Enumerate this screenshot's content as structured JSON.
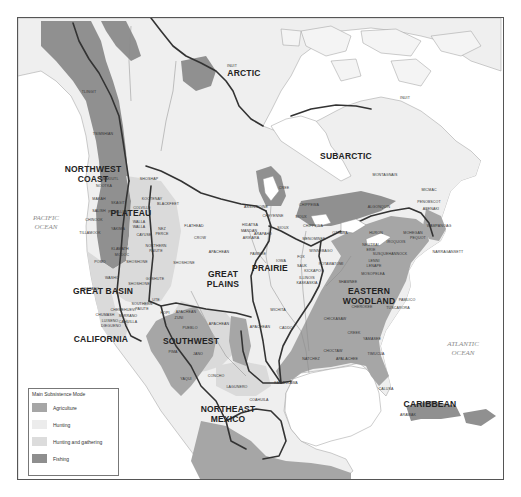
{
  "map": {
    "title": "Main Subsistence Modes of Native North American Culture Areas",
    "oceans": [
      {
        "name": "pacific",
        "lines": [
          "PACIFIC",
          "OCEAN"
        ],
        "x": 45,
        "y": 219
      },
      {
        "name": "atlantic",
        "lines": [
          "ATLANTIC",
          "OCEAN"
        ],
        "x": 462,
        "y": 345
      }
    ],
    "culture_areas": [
      {
        "name": "ARCTIC",
        "x": 243,
        "y": 75
      },
      {
        "name": "SUBARCTIC",
        "x": 345,
        "y": 158
      },
      {
        "name": "NORTHWEST",
        "line2": "COAST",
        "x": 92,
        "y": 171
      },
      {
        "name": "PLATEAU",
        "x": 130,
        "y": 215
      },
      {
        "name": "GREAT BASIN",
        "x": 102,
        "y": 293
      },
      {
        "name": "CALIFORNIA",
        "x": 100,
        "y": 341
      },
      {
        "name": "GREAT",
        "line2": "PLAINS",
        "x": 222,
        "y": 276
      },
      {
        "name": "PRAIRIE",
        "x": 269,
        "y": 270
      },
      {
        "name": "EASTERN",
        "line2": "WOODLAND",
        "x": 368,
        "y": 293
      },
      {
        "name": "SOUTHWEST",
        "x": 190,
        "y": 343
      },
      {
        "name": "NORTHEAST",
        "line2": "MEXICO",
        "x": 227,
        "y": 411
      },
      {
        "name": "CARIBBEAN",
        "x": 429,
        "y": 406
      }
    ],
    "tribes": [
      {
        "name": "INUIT",
        "x": 231,
        "y": 66
      },
      {
        "name": "INUIT",
        "x": 404,
        "y": 98
      },
      {
        "name": "TLINGIT",
        "x": 88,
        "y": 92
      },
      {
        "name": "TSIMSHIAN",
        "x": 102,
        "y": 134
      },
      {
        "name": "KWAKIUTL",
        "x": 108,
        "y": 179
      },
      {
        "name": "SHOSHAP",
        "x": 148,
        "y": 179
      },
      {
        "name": "NOOTKA",
        "x": 103,
        "y": 186
      },
      {
        "name": "MAKAH",
        "x": 98,
        "y": 199
      },
      {
        "name": "KOOTENAY",
        "x": 151,
        "y": 199
      },
      {
        "name": "BLACKFEET",
        "x": 167,
        "y": 204
      },
      {
        "name": "SKAGIT",
        "x": 117,
        "y": 203
      },
      {
        "name": "SALISH",
        "x": 98,
        "y": 211
      },
      {
        "name": "COLVILLE",
        "x": 141,
        "y": 208
      },
      {
        "name": "PUYALLUP",
        "x": 117,
        "y": 212
      },
      {
        "name": "CHINOOK",
        "x": 93,
        "y": 220
      },
      {
        "name": "WALLA",
        "line2": "WALLA",
        "x": 138,
        "y": 222
      },
      {
        "name": "TILLAMOOK",
        "x": 89,
        "y": 233
      },
      {
        "name": "YAKIMA",
        "x": 117,
        "y": 229
      },
      {
        "name": "CAYUSE",
        "x": 143,
        "y": 235
      },
      {
        "name": "NEZ",
        "line2": "PERCE",
        "x": 161,
        "y": 229
      },
      {
        "name": "KLAMATH",
        "x": 119,
        "y": 249
      },
      {
        "name": "MODOC",
        "x": 121,
        "y": 255
      },
      {
        "name": "NORTHERN",
        "line2": "PAIUTE",
        "x": 155,
        "y": 246
      },
      {
        "name": "POMO",
        "x": 99,
        "y": 262
      },
      {
        "name": "WASHO",
        "x": 111,
        "y": 278
      },
      {
        "name": "COSTANO",
        "x": 89,
        "y": 289
      },
      {
        "name": "SHOSHONE",
        "x": 136,
        "y": 262
      },
      {
        "name": "GOSHUTE",
        "x": 154,
        "y": 279
      },
      {
        "name": "SHOSHONE",
        "x": 138,
        "y": 284
      },
      {
        "name": "CHEMEHUEVI",
        "x": 122,
        "y": 310
      },
      {
        "name": "SERRANO",
        "x": 127,
        "y": 316
      },
      {
        "name": "CHUMASH",
        "x": 104,
        "y": 315
      },
      {
        "name": "CAHUILLA",
        "x": 127,
        "y": 322
      },
      {
        "name": "LUISENO",
        "x": 109,
        "y": 321
      },
      {
        "name": "DIEGUENO",
        "x": 110,
        "y": 326
      },
      {
        "name": "SOUTHERN",
        "line2": "PAIUTE",
        "x": 141,
        "y": 304
      },
      {
        "name": "UTE",
        "x": 155,
        "y": 300
      },
      {
        "name": "HOPI",
        "x": 164,
        "y": 313
      },
      {
        "name": "ZUNI",
        "x": 178,
        "y": 318
      },
      {
        "name": "APACHEAN",
        "x": 185,
        "y": 312
      },
      {
        "name": "PUEBLO",
        "x": 189,
        "y": 328
      },
      {
        "name": "PIMA",
        "x": 172,
        "y": 352
      },
      {
        "name": "JANO",
        "x": 197,
        "y": 354
      },
      {
        "name": "YAQUI",
        "x": 185,
        "y": 379
      },
      {
        "name": "CONCHO",
        "x": 215,
        "y": 376
      },
      {
        "name": "LAGUNERO",
        "x": 236,
        "y": 387
      },
      {
        "name": "COAHUILA",
        "x": 258,
        "y": 400
      },
      {
        "name": "KARANKAWA",
        "x": 285,
        "y": 383
      },
      {
        "name": "FLATHEAD",
        "x": 193,
        "y": 226
      },
      {
        "name": "CROW",
        "x": 199,
        "y": 238
      },
      {
        "name": "APACHEAN",
        "x": 218,
        "y": 252
      },
      {
        "name": "SHOSHONE",
        "x": 183,
        "y": 263
      },
      {
        "name": "APACHEAN",
        "x": 259,
        "y": 327
      },
      {
        "name": "APACHEAN",
        "x": 218,
        "y": 324
      },
      {
        "name": "ASSINIBOINE",
        "x": 255,
        "y": 207
      },
      {
        "name": "CREE",
        "x": 283,
        "y": 188
      },
      {
        "name": "CHEYENNE",
        "x": 272,
        "y": 216
      },
      {
        "name": "HIDATSA",
        "x": 249,
        "y": 225
      },
      {
        "name": "MANDAN",
        "x": 248,
        "y": 231
      },
      {
        "name": "ARIKARA",
        "x": 250,
        "y": 238
      },
      {
        "name": "ARAPAHO",
        "x": 262,
        "y": 234
      },
      {
        "name": "SIOUX",
        "x": 282,
        "y": 228
      },
      {
        "name": "CHIPPEWA",
        "x": 308,
        "y": 205
      },
      {
        "name": "SIOUX",
        "x": 300,
        "y": 217
      },
      {
        "name": "CHIPPEWA",
        "x": 312,
        "y": 226
      },
      {
        "name": "OTTAWA",
        "x": 339,
        "y": 233
      },
      {
        "name": "MENOMINEE",
        "x": 313,
        "y": 239
      },
      {
        "name": "WINNEBAGO",
        "x": 320,
        "y": 251
      },
      {
        "name": "PAWNEE",
        "x": 257,
        "y": 254
      },
      {
        "name": "IOWA",
        "x": 280,
        "y": 261
      },
      {
        "name": "FOX",
        "x": 300,
        "y": 257
      },
      {
        "name": "SAUK",
        "x": 301,
        "y": 266
      },
      {
        "name": "POTAWATOMI",
        "x": 330,
        "y": 264
      },
      {
        "name": "KICKAPOO",
        "x": 313,
        "y": 271
      },
      {
        "name": "ILLINOIS",
        "line2": "KASKASKIA",
        "x": 306,
        "y": 278
      },
      {
        "name": "WICHITA",
        "x": 277,
        "y": 310
      },
      {
        "name": "CADDO",
        "x": 285,
        "y": 328
      },
      {
        "name": "ALGONQUIN",
        "x": 378,
        "y": 207
      },
      {
        "name": "MONTAGNAIS",
        "x": 384,
        "y": 175
      },
      {
        "name": "MICMAC",
        "x": 428,
        "y": 190
      },
      {
        "name": "PENOBSCOT",
        "x": 428,
        "y": 202
      },
      {
        "name": "ABENAKI",
        "x": 430,
        "y": 209
      },
      {
        "name": "WAMPANOAG",
        "x": 438,
        "y": 226
      },
      {
        "name": "MOHEGAN",
        "x": 412,
        "y": 233
      },
      {
        "name": "PEQUOT",
        "x": 417,
        "y": 238
      },
      {
        "name": "NARRAGANSETT",
        "x": 447,
        "y": 252
      },
      {
        "name": "HURON",
        "x": 375,
        "y": 233
      },
      {
        "name": "IROQUOIS",
        "x": 395,
        "y": 242
      },
      {
        "name": "NEUTRAL",
        "line2": "ERIE",
        "x": 370,
        "y": 245
      },
      {
        "name": "SUSQUEHANNOCK",
        "x": 389,
        "y": 254
      },
      {
        "name": "LENNI",
        "line2": "LENAPE",
        "x": 373,
        "y": 261
      },
      {
        "name": "MOSOPELEA",
        "x": 372,
        "y": 274
      },
      {
        "name": "SHAWNEE",
        "x": 347,
        "y": 282
      },
      {
        "name": "CHEROKEE",
        "x": 361,
        "y": 307
      },
      {
        "name": "PAMLICO",
        "x": 406,
        "y": 300
      },
      {
        "name": "TUSCARORA",
        "x": 397,
        "y": 308
      },
      {
        "name": "CHICKASAW",
        "x": 334,
        "y": 319
      },
      {
        "name": "CREEK",
        "x": 353,
        "y": 333
      },
      {
        "name": "YAMASEE",
        "x": 371,
        "y": 339
      },
      {
        "name": "CHOCTAW",
        "x": 332,
        "y": 351
      },
      {
        "name": "NATCHEZ",
        "x": 310,
        "y": 359
      },
      {
        "name": "APALACHEE",
        "x": 346,
        "y": 359
      },
      {
        "name": "TIMUCUA",
        "x": 375,
        "y": 354
      },
      {
        "name": "CALUSA",
        "x": 385,
        "y": 389
      },
      {
        "name": "ARAWAK",
        "x": 407,
        "y": 415
      }
    ],
    "legend": {
      "title": "Main Subsistence Mode",
      "items": [
        {
          "label": "Agriculture",
          "color": "#a6a6a6"
        },
        {
          "label": "Hunting",
          "color": "#ececec"
        },
        {
          "label": "Hunting and gathering",
          "color": "#dcdcdc"
        },
        {
          "label": "Fishing",
          "color": "#8e8e8e"
        }
      ]
    },
    "colors": {
      "agriculture": "#a6a6a6",
      "hunting": "#efefef",
      "hunting_gathering": "#dadada",
      "fishing": "#909090",
      "water": "#ffffff",
      "boundary": "#333333"
    }
  }
}
